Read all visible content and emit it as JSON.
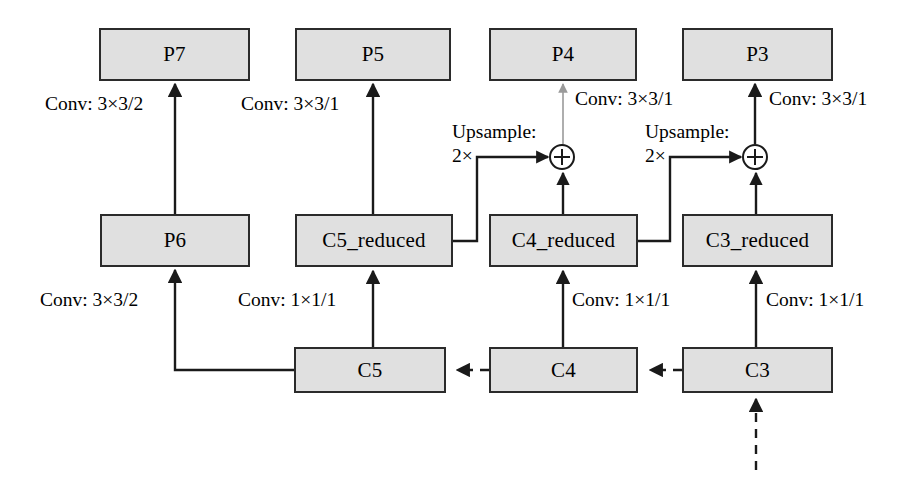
{
  "diagram": {
    "nodes": [
      {
        "id": "p7",
        "label": "P7"
      },
      {
        "id": "p5",
        "label": "P5"
      },
      {
        "id": "p4",
        "label": "P4"
      },
      {
        "id": "p3",
        "label": "P3"
      },
      {
        "id": "p6",
        "label": "P6"
      },
      {
        "id": "c5_reduced",
        "label": "C5_reduced"
      },
      {
        "id": "c4_reduced",
        "label": "C4_reduced"
      },
      {
        "id": "c3_reduced",
        "label": "C3_reduced"
      },
      {
        "id": "c5",
        "label": "C5"
      },
      {
        "id": "c4",
        "label": "C4"
      },
      {
        "id": "c3",
        "label": "C3"
      }
    ],
    "edge_labels": [
      {
        "id": "p6_to_p7",
        "text": "Conv: 3×3/2"
      },
      {
        "id": "c5red_to_p5",
        "text": "Conv: 3×3/1"
      },
      {
        "id": "add4_to_p4",
        "text": "Conv: 3×3/1"
      },
      {
        "id": "add3_to_p3",
        "text": "Conv: 3×3/1"
      },
      {
        "id": "c5_to_p6",
        "text": "Conv: 3×3/2"
      },
      {
        "id": "c5_to_c5red",
        "text": "Conv: 1×1/1"
      },
      {
        "id": "c4_to_c4red",
        "text": "Conv: 1×1/1"
      },
      {
        "id": "c3_to_c3red",
        "text": "Conv: 1×1/1"
      },
      {
        "id": "upsample_c5red",
        "line1": "Upsample:",
        "line2": "2×"
      },
      {
        "id": "upsample_c4red",
        "line1": "Upsample:",
        "line2": "2×"
      }
    ],
    "operators": [
      {
        "id": "add-p4",
        "symbol": "⊕"
      },
      {
        "id": "add-p3",
        "symbol": "⊕"
      }
    ],
    "colors": {
      "node_fill": "#e0e0e0",
      "node_stroke": "#2b2b2b",
      "wire": "#1a1a1a",
      "faded_wire": "#9a9a9a",
      "background": "#ffffff"
    }
  }
}
